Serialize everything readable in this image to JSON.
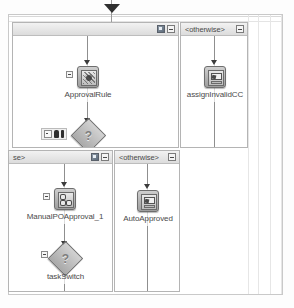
{
  "diagram": {
    "type": "workflow-editor-canvas"
  },
  "panels": [
    {
      "id": "panel-top-left",
      "title": "",
      "icons": [
        "grid-icon",
        "collapse-icon"
      ]
    },
    {
      "id": "panel-top-right",
      "title": "<otherwise>",
      "icons": [
        "collapse-icon"
      ]
    },
    {
      "id": "panel-bottom-left",
      "title": "se>",
      "icons": [
        "grid-icon",
        "collapse-icon"
      ]
    },
    {
      "id": "panel-bottom-right",
      "title": "<otherwise>",
      "icons": [
        "collapse-icon"
      ]
    }
  ],
  "nodes": [
    {
      "id": "approval-rule",
      "label": "ApprovalRule",
      "shape": "rounded-square",
      "icon": "business-rule-icon",
      "panel": "panel-top-left"
    },
    {
      "id": "approval-decision",
      "label": "",
      "shape": "diamond",
      "icon": "decision-question-icon",
      "panel": "panel-top-left"
    },
    {
      "id": "assign-invalid-cc",
      "label": "assignInvalidCC",
      "shape": "rounded-square",
      "icon": "assign-task-icon",
      "panel": "panel-top-right"
    },
    {
      "id": "manual-po-approval",
      "label": "ManualPOApproval_1",
      "shape": "rounded-square",
      "icon": "human-task-icon",
      "panel": "panel-bottom-left"
    },
    {
      "id": "task-switch",
      "label": "taskSwitch",
      "shape": "diamond",
      "icon": "decision-question-icon",
      "panel": "panel-bottom-left"
    },
    {
      "id": "auto-approved",
      "label": "AutoApproved",
      "shape": "rounded-square",
      "icon": "assign-task-icon",
      "panel": "panel-bottom-right"
    }
  ],
  "glyphs": {
    "question_mark": "?"
  },
  "colors": {
    "node_fill": "#b5b5b5",
    "node_border": "#6e6e6e",
    "header_bg": "#e6e6e6",
    "connector": "#8f8f8f",
    "text": "#4a4a4a",
    "canvas": "#ffffff"
  }
}
